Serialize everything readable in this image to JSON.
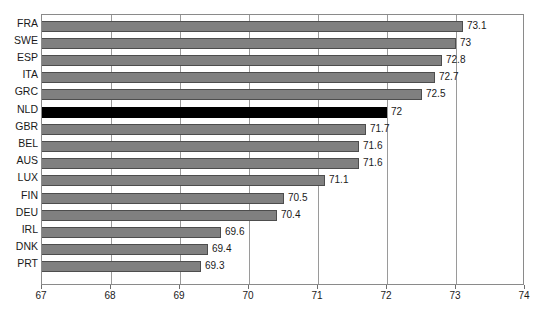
{
  "chart_data": {
    "type": "bar",
    "orientation": "horizontal",
    "title": "",
    "subtitle": "",
    "xlabel": "",
    "ylabel": "",
    "xlim": [
      67,
      74
    ],
    "xticks": [
      67,
      68,
      69,
      70,
      71,
      72,
      73,
      74
    ],
    "xtick_labels": [
      "67",
      "68",
      "69",
      "70",
      "71",
      "72",
      "73",
      "74"
    ],
    "grid": true,
    "grid_axis": "x",
    "legend": false,
    "legend_position": "none",
    "bar_color": "#808080",
    "highlight_color": "#000000",
    "highlighted_categories": [
      "NLD"
    ],
    "categories": [
      "FRA",
      "SWE",
      "ESP",
      "ITA",
      "GRC",
      "NLD",
      "GBR",
      "BEL",
      "AUS",
      "LUX",
      "FIN",
      "DEU",
      "IRL",
      "DNK",
      "PRT"
    ],
    "values": [
      73.1,
      73,
      72.8,
      72.7,
      72.5,
      72,
      71.7,
      71.6,
      71.6,
      71.1,
      70.5,
      70.4,
      69.6,
      69.4,
      69.3
    ],
    "value_labels": [
      "73.1",
      "73",
      "72.8",
      "72.7",
      "72.5",
      "72",
      "71.7",
      "71.6",
      "71.6",
      "71.1",
      "70.5",
      "70.4",
      "69.6",
      "69.4",
      "69.3"
    ]
  }
}
